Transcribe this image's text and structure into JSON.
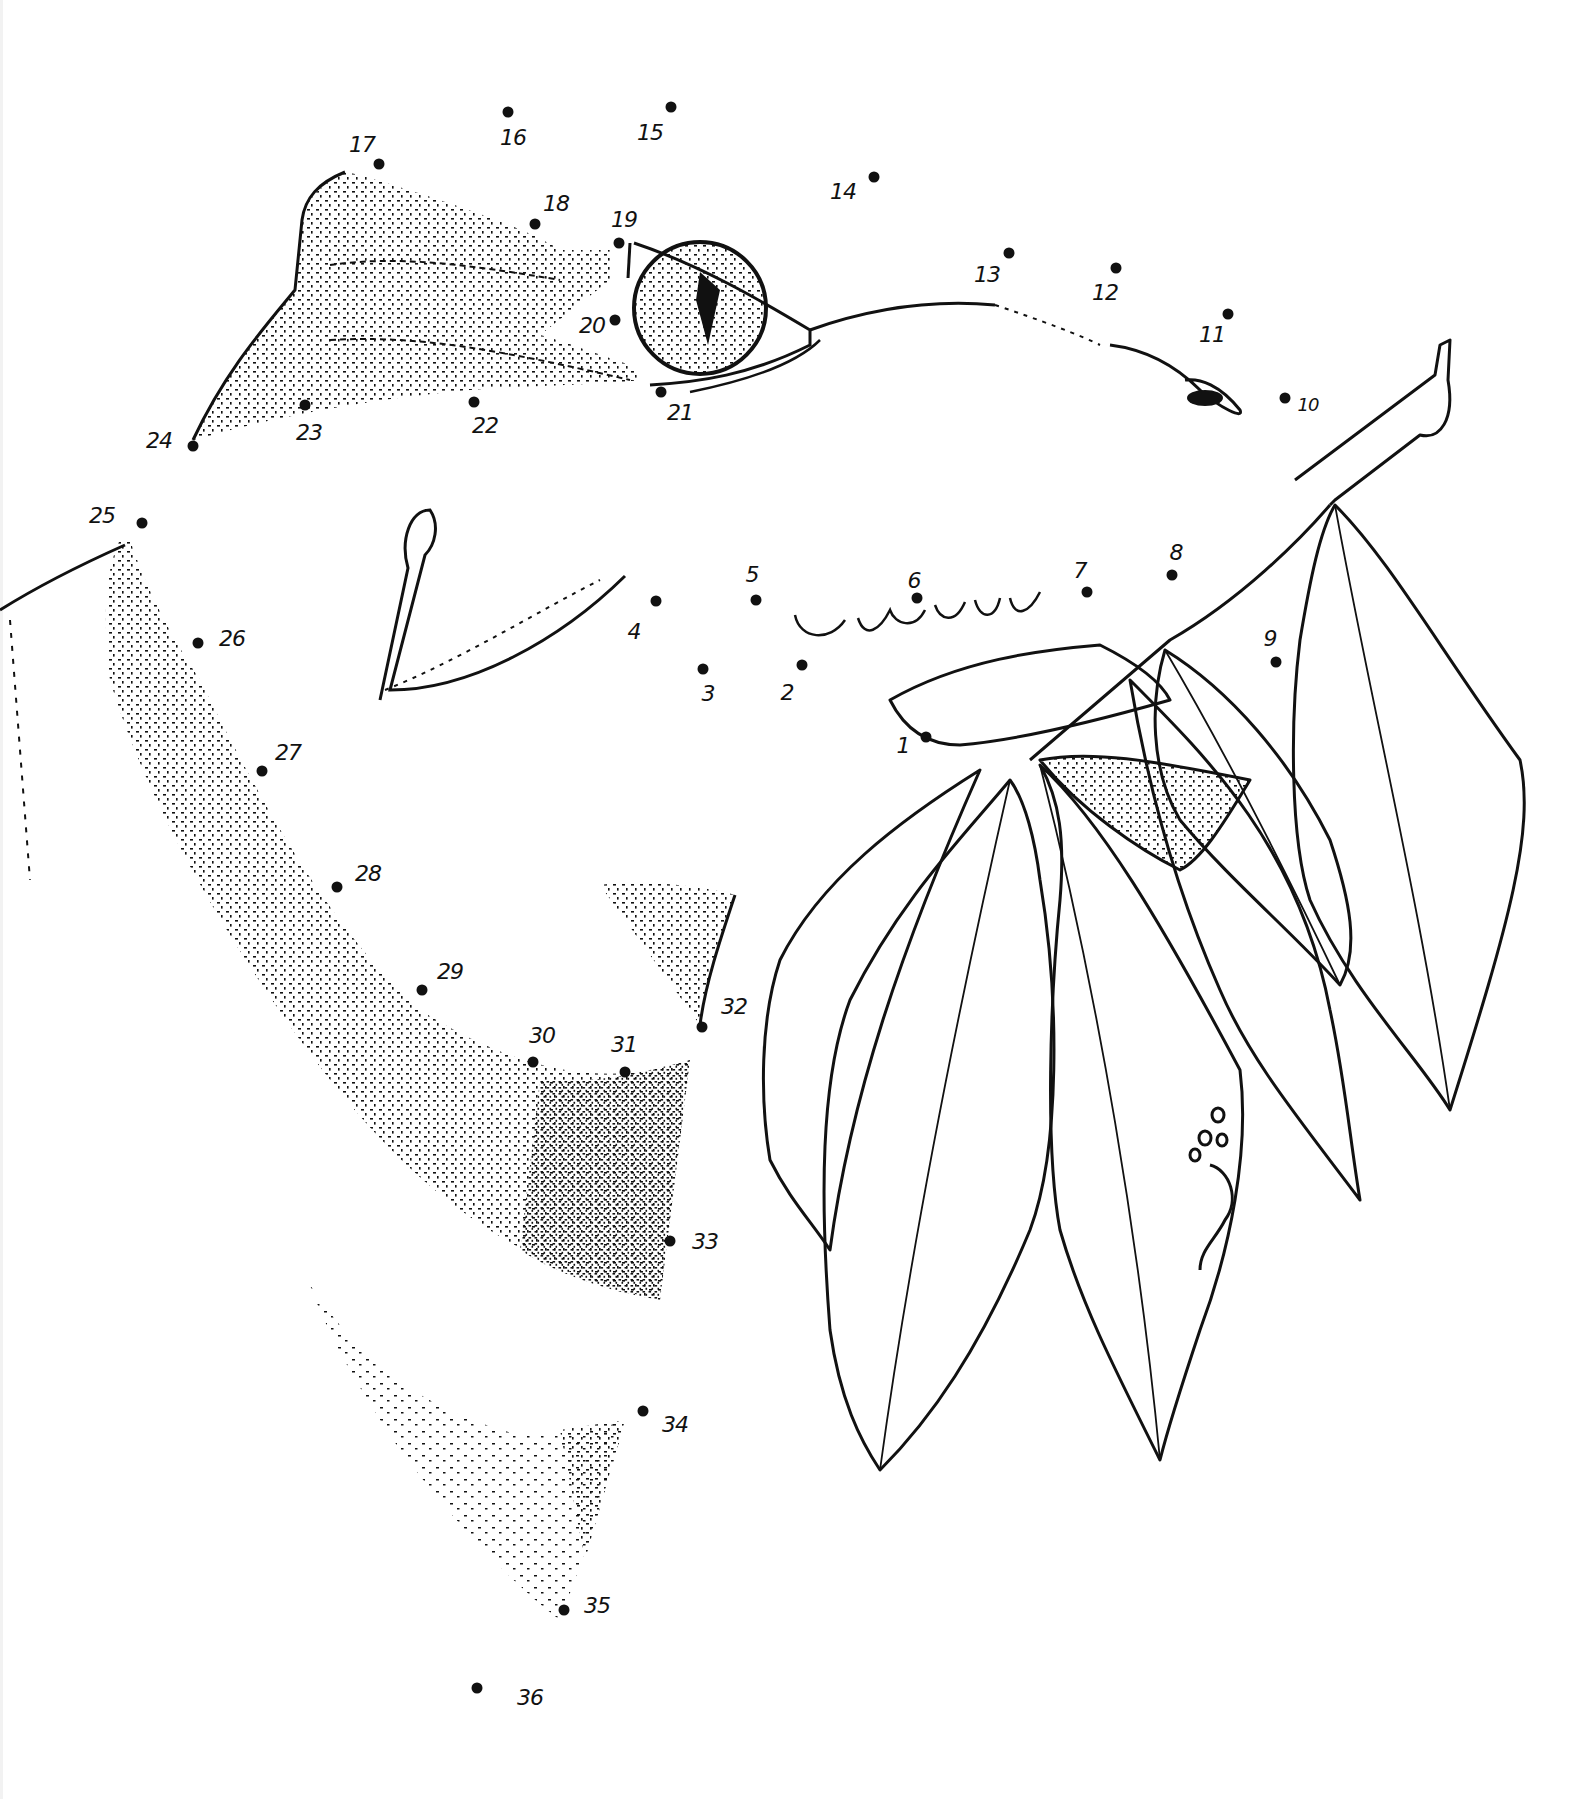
{
  "sheet": {
    "type": "connect-the-dots drawing",
    "subject_partial": "animal head (eye, brow, snout) with leafy branch",
    "ink_color": "#111111",
    "paper_color": "#ffffff"
  },
  "dots": [
    {
      "n": "1",
      "x": 926,
      "y": 737,
      "lx": 903,
      "ly": 745
    },
    {
      "n": "2",
      "x": 802,
      "y": 665,
      "lx": 787,
      "ly": 692
    },
    {
      "n": "3",
      "x": 703,
      "y": 669,
      "lx": 708,
      "ly": 693
    },
    {
      "n": "4",
      "x": 656,
      "y": 601,
      "lx": 634,
      "ly": 631
    },
    {
      "n": "5",
      "x": 756,
      "y": 600,
      "lx": 752,
      "ly": 574
    },
    {
      "n": "6",
      "x": 917,
      "y": 598,
      "lx": 914,
      "ly": 580
    },
    {
      "n": "7",
      "x": 1087,
      "y": 592,
      "lx": 1080,
      "ly": 570
    },
    {
      "n": "8",
      "x": 1172,
      "y": 575,
      "lx": 1176,
      "ly": 552
    },
    {
      "n": "9",
      "x": 1276,
      "y": 662,
      "lx": 1270,
      "ly": 638
    },
    {
      "n": "10",
      "x": 1285,
      "y": 398,
      "lx": 1308,
      "ly": 404
    },
    {
      "n": "11",
      "x": 1228,
      "y": 314,
      "lx": 1212,
      "ly": 334
    },
    {
      "n": "12",
      "x": 1116,
      "y": 268,
      "lx": 1105,
      "ly": 292
    },
    {
      "n": "13",
      "x": 1009,
      "y": 253,
      "lx": 987,
      "ly": 274
    },
    {
      "n": "14",
      "x": 874,
      "y": 177,
      "lx": 843,
      "ly": 191
    },
    {
      "n": "15",
      "x": 671,
      "y": 107,
      "lx": 650,
      "ly": 132
    },
    {
      "n": "16",
      "x": 508,
      "y": 112,
      "lx": 513,
      "ly": 137
    },
    {
      "n": "17",
      "x": 379,
      "y": 164,
      "lx": 362,
      "ly": 144
    },
    {
      "n": "18",
      "x": 535,
      "y": 224,
      "lx": 556,
      "ly": 203
    },
    {
      "n": "19",
      "x": 619,
      "y": 243,
      "lx": 624,
      "ly": 219
    },
    {
      "n": "20",
      "x": 615,
      "y": 320,
      "lx": 592,
      "ly": 325
    },
    {
      "n": "21",
      "x": 661,
      "y": 392,
      "lx": 680,
      "ly": 412
    },
    {
      "n": "22",
      "x": 474,
      "y": 402,
      "lx": 485,
      "ly": 425
    },
    {
      "n": "23",
      "x": 305,
      "y": 405,
      "lx": 309,
      "ly": 432
    },
    {
      "n": "24",
      "x": 193,
      "y": 446,
      "lx": 159,
      "ly": 440
    },
    {
      "n": "25",
      "x": 142,
      "y": 523,
      "lx": 102,
      "ly": 515
    },
    {
      "n": "26",
      "x": 198,
      "y": 643,
      "lx": 232,
      "ly": 638
    },
    {
      "n": "27",
      "x": 262,
      "y": 771,
      "lx": 288,
      "ly": 752
    },
    {
      "n": "28",
      "x": 337,
      "y": 887,
      "lx": 368,
      "ly": 873
    },
    {
      "n": "29",
      "x": 422,
      "y": 990,
      "lx": 450,
      "ly": 971
    },
    {
      "n": "30",
      "x": 533,
      "y": 1062,
      "lx": 542,
      "ly": 1035
    },
    {
      "n": "31",
      "x": 625,
      "y": 1072,
      "lx": 624,
      "ly": 1044
    },
    {
      "n": "32",
      "x": 702,
      "y": 1027,
      "lx": 734,
      "ly": 1006
    },
    {
      "n": "33",
      "x": 670,
      "y": 1241,
      "lx": 705,
      "ly": 1241
    },
    {
      "n": "34",
      "x": 643,
      "y": 1411,
      "lx": 675,
      "ly": 1424
    },
    {
      "n": "35",
      "x": 564,
      "y": 1610,
      "lx": 597,
      "ly": 1605
    },
    {
      "n": "36",
      "x": 477,
      "y": 1688,
      "lx": 530,
      "ly": 1697
    }
  ]
}
